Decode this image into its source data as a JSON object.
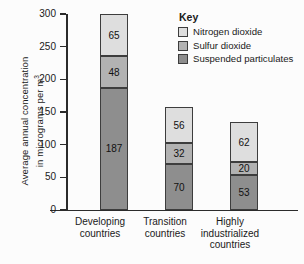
{
  "chart_data": {
    "type": "bar",
    "subtype": "stacked-bar",
    "title": "",
    "xlabel": "",
    "ylabel_line1": "Average annual concentration",
    "ylabel_line2": "in micrograms per m",
    "ylabel_sup": "3",
    "categories": [
      "Developing countries",
      "Transition countries",
      "Highly industrialized countries"
    ],
    "category_lines": [
      [
        "Developing",
        "countries"
      ],
      [
        "Transition",
        "countries"
      ],
      [
        "Highly",
        "industrialized",
        "countries"
      ]
    ],
    "series": [
      {
        "name": "Suspended particulates",
        "values": [
          187,
          70,
          53
        ],
        "color": "#8e8e8e"
      },
      {
        "name": "Sulfur dioxide",
        "values": [
          48,
          32,
          20
        ],
        "color": "#b2b2b2"
      },
      {
        "name": "Nitrogen dioxide",
        "values": [
          65,
          56,
          62
        ],
        "color": "#dedede"
      }
    ],
    "totals": [
      300,
      158,
      135
    ],
    "ylim": [
      0,
      300
    ],
    "yticks": [
      0,
      50,
      100,
      150,
      200,
      250,
      300
    ],
    "ytick_labels": [
      "0",
      "50",
      "100",
      "150",
      "200",
      "250",
      "300"
    ],
    "grid": false,
    "legend_position": "top-right"
  },
  "legend": {
    "title": "Key",
    "entries": [
      {
        "label": "Nitrogen dioxide",
        "swatch": "np"
      },
      {
        "label": "Sulfur dioxide",
        "swatch": "sd"
      },
      {
        "label": "Suspended particulates",
        "swatch": "sp"
      }
    ]
  },
  "bars": [
    {
      "category": "Developing countries",
      "segments": [
        {
          "label": "65",
          "value": 65,
          "series": "Nitrogen dioxide",
          "cls": "np"
        },
        {
          "label": "48",
          "value": 48,
          "series": "Sulfur dioxide",
          "cls": "sd"
        },
        {
          "label": "187",
          "value": 187,
          "series": "Suspended particulates",
          "cls": "sp"
        }
      ]
    },
    {
      "category": "Transition countries",
      "segments": [
        {
          "label": "56",
          "value": 56,
          "series": "Nitrogen dioxide",
          "cls": "np"
        },
        {
          "label": "32",
          "value": 32,
          "series": "Sulfur dioxide",
          "cls": "sd"
        },
        {
          "label": "70",
          "value": 70,
          "series": "Suspended particulates",
          "cls": "sp"
        }
      ]
    },
    {
      "category": "Highly industrialized countries",
      "segments": [
        {
          "label": "62",
          "value": 62,
          "series": "Nitrogen dioxide",
          "cls": "np"
        },
        {
          "label": "20",
          "value": 20,
          "series": "Sulfur dioxide",
          "cls": "sd"
        },
        {
          "label": "53",
          "value": 53,
          "series": "Suspended particulates",
          "cls": "sp"
        }
      ]
    }
  ],
  "colors": {
    "nitrogen_dioxide": "#dedede",
    "sulfur_dioxide": "#b2b2b2",
    "suspended_particulates": "#8e8e8e",
    "axis": "#2b2b2b",
    "background": "#fcfcfc"
  }
}
